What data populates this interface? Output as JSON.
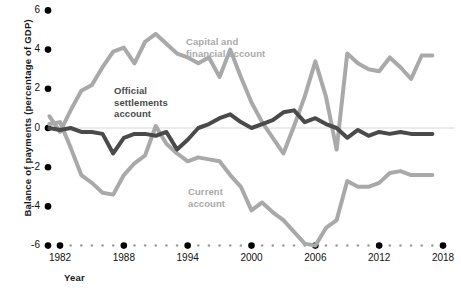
{
  "chart_data": {
    "type": "line",
    "title": "",
    "xlabel": "Year",
    "ylabel": "Balance of payments (percentage of GDP)",
    "xlim": [
      1981,
      2018
    ],
    "ylim": [
      -6,
      6
    ],
    "grid": false,
    "zero_line": true,
    "legend": "inline-annotations",
    "ytick_labels": [
      "6",
      "4",
      "2",
      "0",
      "-2",
      "-4",
      "-6"
    ],
    "ytick_values": [
      6,
      4,
      2,
      0,
      -2,
      -4,
      -6
    ],
    "xtick_labels": [
      "1982",
      "1988",
      "1994",
      "2000",
      "2006",
      "2012",
      "2018"
    ],
    "xtick_values": [
      1982,
      1988,
      1994,
      2000,
      2006,
      2012,
      2018
    ],
    "x": [
      1981,
      1982,
      1983,
      1984,
      1985,
      1986,
      1987,
      1988,
      1989,
      1990,
      1991,
      1992,
      1993,
      1994,
      1995,
      1996,
      1997,
      1998,
      1999,
      2000,
      2001,
      2002,
      2003,
      2004,
      2005,
      2006,
      2007,
      2008,
      2009,
      2010,
      2011,
      2012,
      2013,
      2014,
      2015,
      2016,
      2017
    ],
    "series": [
      {
        "name": "Capital and financial account",
        "color": "#a9a9a9",
        "label_lines": [
          "Capital and",
          "financial account"
        ],
        "values": [
          0.6,
          -0.2,
          0.9,
          1.9,
          2.2,
          3.1,
          3.9,
          4.1,
          3.3,
          4.4,
          4.8,
          4.3,
          3.8,
          3.6,
          3.3,
          3.6,
          2.6,
          4.0,
          2.6,
          1.3,
          0.3,
          -0.5,
          -1.3,
          0.1,
          1.6,
          3.4,
          1.6,
          -1.1,
          3.8,
          3.3,
          3.0,
          2.9,
          3.6,
          3.1,
          2.5,
          3.7,
          3.7
        ]
      },
      {
        "name": "Current account",
        "color": "#a9a9a9",
        "label_lines": [
          "Current",
          "account"
        ],
        "values": [
          0.2,
          0.3,
          -1.0,
          -2.4,
          -2.8,
          -3.3,
          -3.4,
          -2.4,
          -1.8,
          -1.4,
          0.1,
          -0.8,
          -1.3,
          -1.7,
          -1.5,
          -1.6,
          -1.7,
          -2.4,
          -3.0,
          -4.2,
          -3.8,
          -4.3,
          -4.7,
          -5.3,
          -5.9,
          -6.0,
          -5.1,
          -4.7,
          -2.7,
          -3.0,
          -3.0,
          -2.8,
          -2.3,
          -2.2,
          -2.4,
          -2.4,
          -2.4
        ]
      },
      {
        "name": "Official settlements account",
        "color": "#4a4a4a",
        "label_lines": [
          "Official",
          "settlements",
          "account"
        ],
        "values": [
          0.0,
          -0.1,
          0.0,
          -0.2,
          -0.2,
          -0.3,
          -1.3,
          -0.5,
          -0.3,
          -0.3,
          -0.4,
          -0.2,
          -1.1,
          -0.6,
          0.0,
          0.2,
          0.5,
          0.7,
          0.3,
          0.0,
          0.2,
          0.4,
          0.8,
          0.9,
          0.3,
          0.5,
          0.2,
          0.0,
          -0.5,
          -0.1,
          -0.4,
          -0.2,
          -0.3,
          -0.2,
          -0.3,
          -0.3,
          -0.3
        ]
      }
    ]
  }
}
